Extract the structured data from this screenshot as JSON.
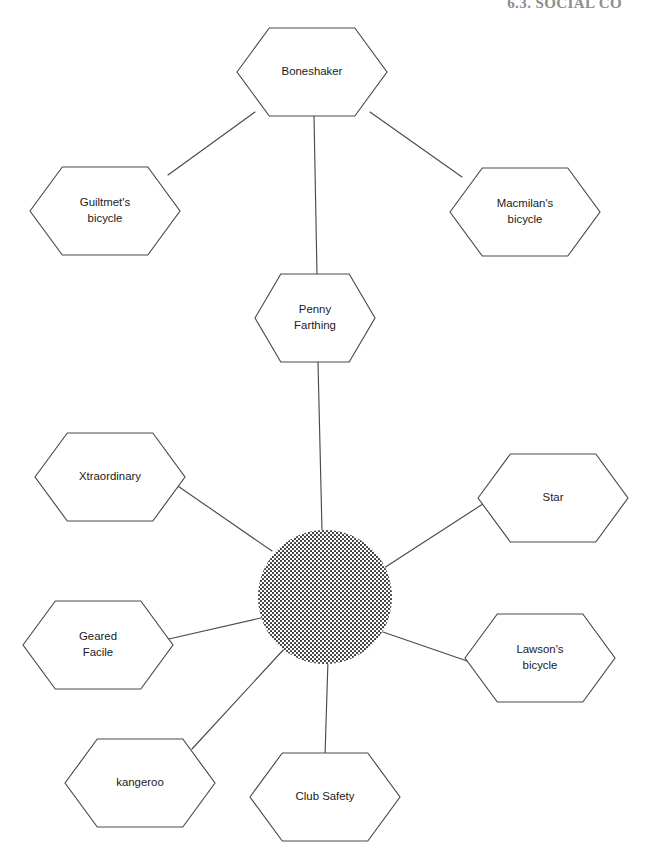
{
  "page": {
    "header": "6.3. SOCIAL CO",
    "width": 646,
    "height": 867,
    "background": "#ffffff",
    "line_color": "#4a4a4a",
    "text_color": "#1a1a1a",
    "header_color": "#8e8e8e"
  },
  "diagram": {
    "type": "concept-map",
    "hub": {
      "name": "stippled-hub",
      "shape": "circle",
      "fill_pattern": "halftone-dots",
      "cx": 325,
      "cy": 597,
      "r": 67,
      "label": ""
    },
    "nodes": [
      {
        "id": "boneshaker",
        "label": "Boneshaker",
        "lines": [
          "Boneshaker"
        ],
        "shape": "hexagon",
        "cx": 312,
        "cy": 72,
        "w": 150,
        "h": 88
      },
      {
        "id": "guiltmets-bicycle",
        "label": "Guiltmet's bicycle",
        "lines": [
          "Guiltmet's",
          "bicycle"
        ],
        "shape": "hexagon",
        "cx": 105,
        "cy": 211,
        "w": 150,
        "h": 88
      },
      {
        "id": "macmilans-bicycle",
        "label": "Macmilan's bicycle",
        "lines": [
          "Macmilan's",
          "bicycle"
        ],
        "shape": "hexagon",
        "cx": 525,
        "cy": 212,
        "w": 150,
        "h": 88
      },
      {
        "id": "penny-farthing",
        "label": "Penny Farthing",
        "lines": [
          "Penny",
          "Farthing"
        ],
        "shape": "hexagon",
        "cx": 315,
        "cy": 318,
        "w": 120,
        "h": 88
      },
      {
        "id": "xtraordinary",
        "label": "Xtraordinary",
        "lines": [
          "Xtraordinary"
        ],
        "shape": "hexagon",
        "cx": 110,
        "cy": 477,
        "w": 150,
        "h": 88
      },
      {
        "id": "star",
        "label": "Star",
        "lines": [
          "Star"
        ],
        "shape": "hexagon",
        "cx": 553,
        "cy": 498,
        "w": 150,
        "h": 88
      },
      {
        "id": "geared-facile",
        "label": "Geared Facile",
        "lines": [
          "Geared",
          "Facile"
        ],
        "shape": "hexagon",
        "cx": 98,
        "cy": 645,
        "w": 150,
        "h": 88
      },
      {
        "id": "lawsons-bicycle",
        "label": "Lawson's bicycle",
        "lines": [
          "Lawson's",
          "bicycle"
        ],
        "shape": "hexagon",
        "cx": 540,
        "cy": 658,
        "w": 150,
        "h": 88
      },
      {
        "id": "kangeroo",
        "label": "kangeroo",
        "lines": [
          "kangeroo"
        ],
        "shape": "hexagon",
        "cx": 140,
        "cy": 783,
        "w": 150,
        "h": 88
      },
      {
        "id": "club-safety",
        "label": "Club Safety",
        "lines": [
          "Club Safety"
        ],
        "shape": "hexagon",
        "cx": 325,
        "cy": 797,
        "w": 150,
        "h": 88
      }
    ],
    "edges": [
      {
        "id": "e-boneshaker-guiltmets",
        "from": "boneshaker",
        "to": "guiltmets-bicycle",
        "x1": 255,
        "y1": 112,
        "x2": 168,
        "y2": 175
      },
      {
        "id": "e-boneshaker-macmilans",
        "from": "boneshaker",
        "to": "macmilans-bicycle",
        "x1": 370,
        "y1": 112,
        "x2": 462,
        "y2": 177
      },
      {
        "id": "e-boneshaker-penny",
        "from": "boneshaker",
        "to": "penny-farthing",
        "x1": 314,
        "y1": 116,
        "x2": 317,
        "y2": 275
      },
      {
        "id": "e-penny-hub",
        "from": "penny-farthing",
        "to": "stippled-hub",
        "x1": 318,
        "y1": 362,
        "x2": 322,
        "y2": 531
      },
      {
        "id": "e-hub-xtraordinary",
        "from": "stippled-hub",
        "to": "xtraordinary",
        "x1": 272,
        "y1": 551,
        "x2": 172,
        "y2": 482
      },
      {
        "id": "e-hub-star",
        "from": "stippled-hub",
        "to": "star",
        "x1": 384,
        "y1": 568,
        "x2": 489,
        "y2": 500
      },
      {
        "id": "e-hub-geared-facile",
        "from": "stippled-hub",
        "to": "geared-facile",
        "x1": 265,
        "y1": 617,
        "x2": 160,
        "y2": 641
      },
      {
        "id": "e-hub-lawsons",
        "from": "stippled-hub",
        "to": "lawsons-bicycle",
        "x1": 383,
        "y1": 632,
        "x2": 470,
        "y2": 662
      },
      {
        "id": "e-hub-kangeroo",
        "from": "stippled-hub",
        "to": "kangeroo",
        "x1": 285,
        "y1": 648,
        "x2": 192,
        "y2": 749
      },
      {
        "id": "e-hub-club-safety",
        "from": "stippled-hub",
        "to": "club-safety",
        "x1": 328,
        "y1": 660,
        "x2": 325,
        "y2": 756
      }
    ]
  }
}
